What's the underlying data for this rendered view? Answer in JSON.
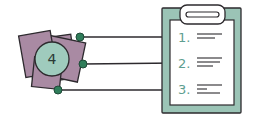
{
  "diagram": {
    "hub": {
      "label": "4",
      "circle_color": "#9fcbbd",
      "square_color": "#a98aa3",
      "outline_color": "#2d2a2e"
    },
    "connector_dot_color": "#2f7d5a",
    "clipboard": {
      "board_color": "#9bc4b6",
      "paper_color": "#ffffff",
      "items": [
        {
          "number": "1."
        },
        {
          "number": "2."
        },
        {
          "number": "3."
        }
      ],
      "number_color": "#5e9e90"
    }
  }
}
